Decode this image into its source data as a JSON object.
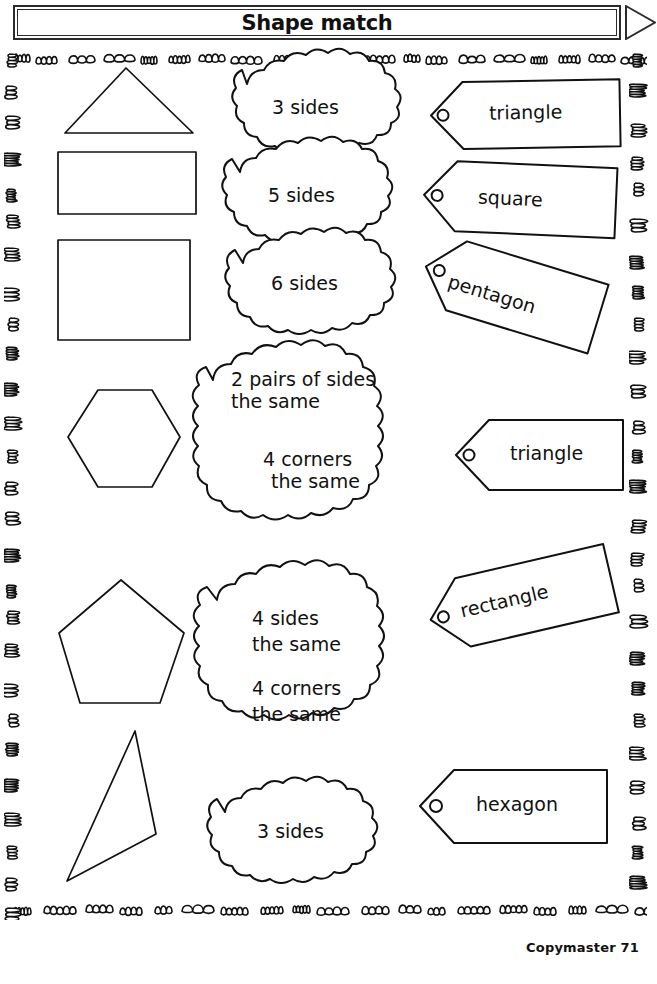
{
  "header": {
    "title": "Shape match",
    "arrow_icon": "arrow-right-icon"
  },
  "footer": {
    "copymaster": "Copymaster 71"
  },
  "colors": {
    "ink": "#111111",
    "banner_border": "#2b2b2b",
    "paper": "#ffffff"
  },
  "shapes": [
    {
      "name": "triangle-isosceles",
      "label": "isosceles triangle"
    },
    {
      "name": "rectangle",
      "label": "rectangle"
    },
    {
      "name": "square",
      "label": "square"
    },
    {
      "name": "hexagon",
      "label": "hexagon"
    },
    {
      "name": "pentagon",
      "label": "pentagon"
    },
    {
      "name": "triangle-scalene",
      "label": "scalene triangle"
    }
  ],
  "clouds": [
    {
      "name": "cloud-3-sides-top",
      "lines": [
        "3 sides"
      ],
      "align": "center"
    },
    {
      "name": "cloud-5-sides",
      "lines": [
        "5 sides"
      ],
      "align": "center"
    },
    {
      "name": "cloud-6-sides",
      "lines": [
        "6 sides"
      ],
      "align": "center"
    },
    {
      "name": "cloud-2-pairs",
      "lines": [
        "2 pairs of sides",
        "the same",
        "",
        "4 corners",
        "the same"
      ],
      "align": "mixed"
    },
    {
      "name": "cloud-4-sides",
      "lines": [
        "4 sides",
        "the same",
        "",
        "4 corners",
        "the same"
      ],
      "align": "left"
    },
    {
      "name": "cloud-3-sides-bottom",
      "lines": [
        "3 sides"
      ],
      "align": "center"
    }
  ],
  "cloud_text": {
    "three_sides_top": "3 sides",
    "five_sides": "5 sides",
    "six_sides": "6 sides",
    "two_pairs_l1": "2 pairs of sides",
    "two_pairs_l2": "the same",
    "two_pairs_l3": "4 corners",
    "two_pairs_l4": "the same",
    "four_sides_l1": "4 sides",
    "four_sides_l2": "the same",
    "four_sides_l3": "4 corners",
    "four_sides_l4": "the same",
    "three_sides_bottom": "3 sides"
  },
  "tags": [
    {
      "name": "tag-triangle-1",
      "label": "triangle"
    },
    {
      "name": "tag-square",
      "label": "square"
    },
    {
      "name": "tag-pentagon",
      "label": "pentagon"
    },
    {
      "name": "tag-triangle-2",
      "label": "triangle"
    },
    {
      "name": "tag-rectangle",
      "label": "rectangle"
    },
    {
      "name": "tag-hexagon",
      "label": "hexagon"
    }
  ],
  "tag_labels": {
    "triangle_1": "triangle",
    "square": "square",
    "pentagon": "pentagon",
    "triangle_2": "triangle",
    "rectangle": "rectangle",
    "hexagon": "hexagon"
  }
}
